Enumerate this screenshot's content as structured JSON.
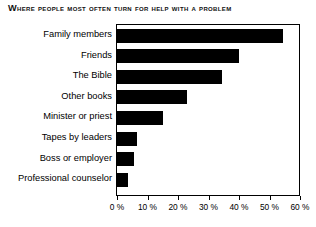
{
  "chart_data": {
    "type": "bar",
    "orientation": "horizontal",
    "title": "Where People Most Often Turn for Help With a Problem",
    "xlabel": "",
    "ylabel": "",
    "categories": [
      "Family members",
      "Friends",
      "The Bible",
      "Other books",
      "Minister or priest",
      "Tapes by leaders",
      "Boss or employer",
      "Professional counselor"
    ],
    "values": [
      54.5,
      40,
      34.5,
      23,
      15,
      6.5,
      5.5,
      3.5
    ],
    "xlim": [
      0,
      60
    ],
    "xticks": [
      0,
      10,
      20,
      30,
      40,
      50,
      60
    ],
    "xtick_labels": [
      "0 %",
      "10 %",
      "20 %",
      "30 %",
      "40 %",
      "50 %",
      "60 %"
    ],
    "grid": false,
    "legend": null,
    "bar_color": "#000000",
    "frame_color": "#000000",
    "background": "#ffffff"
  }
}
